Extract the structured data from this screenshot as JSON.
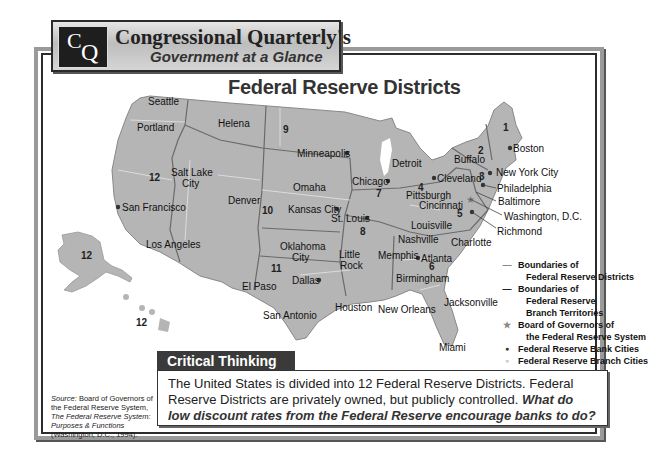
{
  "banner": {
    "logo_c": "C",
    "logo_q": "Q",
    "title": "Congressional Quarterly's",
    "subtitle": "Government at a Glance"
  },
  "map": {
    "title": "Federal Reserve Districts",
    "colors": {
      "land": "#b5b5b5",
      "boundary": "#6a6a6a",
      "branch_boundary": "#e8e8e8",
      "water": "#ffffff"
    },
    "districts": [
      {
        "num": "1",
        "x": 505,
        "y": 124
      },
      {
        "num": "2",
        "x": 478,
        "y": 146
      },
      {
        "num": "3",
        "x": 480,
        "y": 175
      },
      {
        "num": "4",
        "x": 418,
        "y": 184
      },
      {
        "num": "5",
        "x": 458,
        "y": 209
      },
      {
        "num": "6",
        "x": 429,
        "y": 263
      },
      {
        "num": "7",
        "x": 376,
        "y": 190
      },
      {
        "num": "8",
        "x": 361,
        "y": 229
      },
      {
        "num": "9",
        "x": 283,
        "y": 127
      },
      {
        "num": "10",
        "x": 262,
        "y": 208
      },
      {
        "num": "11",
        "x": 271,
        "y": 266
      },
      {
        "num": "12",
        "x": 149,
        "y": 175
      },
      {
        "num": "12",
        "x": 81,
        "y": 253
      },
      {
        "num": "12",
        "x": 136,
        "y": 320
      }
    ],
    "bank_cities": [
      {
        "name": "Boston",
        "x": 510,
        "y": 148,
        "dx": 3,
        "dy": -10
      },
      {
        "name": "New York City",
        "x": 490,
        "y": 173,
        "dx": 5,
        "dy": -6
      },
      {
        "name": "Philadelphia",
        "x": 483,
        "y": 185,
        "dx": 6,
        "dy": 2
      },
      {
        "name": "Cleveland",
        "x": 434,
        "y": 178,
        "dx": 4,
        "dy": -6
      },
      {
        "name": "Richmond",
        "x": 472,
        "y": 212,
        "dx": 14,
        "dy": 14
      },
      {
        "name": "Atlanta",
        "x": 418,
        "y": 258,
        "dx": 3,
        "dy": -6
      },
      {
        "name": "Chicago",
        "x": 388,
        "y": 181,
        "dx": -46,
        "dy": -6
      },
      {
        "name": "St. Louis",
        "x": 367,
        "y": 218,
        "dx": -44,
        "dy": -6
      },
      {
        "name": "Minneapolis",
        "x": 347,
        "y": 153,
        "dx": -49,
        "dy": -6
      },
      {
        "name": "Kansas City",
        "x": 337,
        "y": 209,
        "dx": -55,
        "dy": -6
      },
      {
        "name": "Dallas",
        "x": 319,
        "y": 280,
        "dx": -32,
        "dy": -6
      },
      {
        "name": "San Francisco",
        "x": 118,
        "y": 207,
        "dx": 5,
        "dy": -6
      }
    ],
    "branch_cities": [
      {
        "name": "Seattle",
        "x": 148,
        "y": 103
      },
      {
        "name": "Portland",
        "x": 137,
        "y": 123
      },
      {
        "name": "Helena",
        "x": 220,
        "y": 117
      },
      {
        "name": "Salt Lake",
        "x": 172,
        "y": 167
      },
      {
        "name": "City",
        "x": 182,
        "y": 178
      },
      {
        "name": "Denver",
        "x": 228,
        "y": 195
      },
      {
        "name": "Los Angeles",
        "x": 145,
        "y": 240
      },
      {
        "name": "Omaha",
        "x": 293,
        "y": 182
      },
      {
        "name": "Detroit",
        "x": 392,
        "y": 158
      },
      {
        "name": "Buffalo",
        "x": 455,
        "y": 153
      },
      {
        "name": "Pittsburgh",
        "x": 406,
        "y": 187
      },
      {
        "name": "Cincinnati",
        "x": 420,
        "y": 197
      },
      {
        "name": "Baltimore",
        "x": 498,
        "y": 197
      },
      {
        "name": "Washington, D.C.",
        "x": 504,
        "y": 211
      },
      {
        "name": "Louisville",
        "x": 411,
        "y": 219
      },
      {
        "name": "Nashville",
        "x": 398,
        "y": 235
      },
      {
        "name": "Charlotte",
        "x": 451,
        "y": 236
      },
      {
        "name": "Memphis",
        "x": 380,
        "y": 249
      },
      {
        "name": "Birmingham",
        "x": 397,
        "y": 271
      },
      {
        "name": "Oklahoma",
        "x": 281,
        "y": 242
      },
      {
        "name": "City",
        "x": 292,
        "y": 253
      },
      {
        "name": "Little",
        "x": 340,
        "y": 249
      },
      {
        "name": "Rock",
        "x": 341,
        "y": 260
      },
      {
        "name": "El Paso",
        "x": 242,
        "y": 282
      },
      {
        "name": "San Antonio",
        "x": 264,
        "y": 310
      },
      {
        "name": "Houston",
        "x": 336,
        "y": 302
      },
      {
        "name": "New Orleans",
        "x": 380,
        "y": 304
      },
      {
        "name": "Jacksonville",
        "x": 444,
        "y": 298
      },
      {
        "name": "Miami",
        "x": 439,
        "y": 343
      }
    ],
    "board_of_governors_star": {
      "x": 470,
      "y": 199
    }
  },
  "legend": {
    "items": [
      {
        "symbol": "—",
        "lines": [
          "Boundaries of",
          "Federal Reserve Districts"
        ],
        "symbol_color": "#888888"
      },
      {
        "symbol": "—",
        "lines": [
          "Boundaries of",
          "Federal Reserve",
          "Branch Territories"
        ],
        "symbol_color": "#222222"
      },
      {
        "symbol": "★",
        "lines": [
          "Board of Governors of",
          "the Federal Reserve System"
        ],
        "symbol_color": "#888888"
      },
      {
        "symbol": "●",
        "lines": [
          "Federal Reserve Bank Cities"
        ],
        "symbol_color": "#333333"
      },
      {
        "symbol": "●",
        "lines": [
          "Federal Reserve Branch Cities"
        ],
        "symbol_color": "#cccccc"
      }
    ]
  },
  "critical_thinking": {
    "heading": "Critical Thinking",
    "body": "The United States is divided into 12 Federal Reserve Districts. Federal Reserve Districts are privately owned, but publicly controlled. ",
    "question": "What do low discount rates from the Federal Reserve encourage banks to do?"
  },
  "source": {
    "label": "Source:",
    "text1": " Board of Governors of the Federal Reserve System, ",
    "title": "The Federal Reserve System: Purposes & Functions",
    "text2": " (Washington, D.C., 1994)."
  }
}
